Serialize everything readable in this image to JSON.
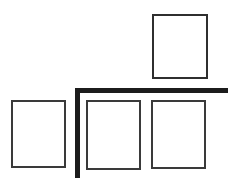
{
  "diagram": {
    "canvas": {
      "width": 236,
      "height": 188,
      "background_color": "#ffffff"
    },
    "stroke_color": "#2b2b2b",
    "bar_color": "#1c1c1c",
    "fill_color": "#ffffff",
    "shapes": [
      {
        "name": "rectangle-top",
        "label": "",
        "x": 152,
        "y": 14,
        "width": 56,
        "height": 65,
        "border_width": 2,
        "border_color": "#2f2f2f",
        "fill": "#ffffff"
      },
      {
        "name": "rectangle-bottom-left",
        "label": "",
        "x": 11,
        "y": 100,
        "width": 55,
        "height": 68,
        "border_width": 2,
        "border_color": "#3a3a3a",
        "fill": "#ffffff"
      },
      {
        "name": "rectangle-bottom-middle",
        "label": "",
        "x": 86,
        "y": 100,
        "width": 55,
        "height": 70,
        "border_width": 2,
        "border_color": "#3a3a3a",
        "fill": "#ffffff"
      },
      {
        "name": "rectangle-bottom-right",
        "label": "",
        "x": 151,
        "y": 100,
        "width": 55,
        "height": 69,
        "border_width": 2,
        "border_color": "#3a3a3a",
        "fill": "#ffffff"
      }
    ],
    "bars": [
      {
        "name": "horizontal-bar",
        "label": "",
        "x": 75,
        "y": 88,
        "width": 153,
        "height": 5,
        "color": "#1c1c1c"
      },
      {
        "name": "vertical-bar",
        "label": "",
        "x": 75,
        "y": 88,
        "width": 5,
        "height": 90,
        "color": "#1c1c1c"
      }
    ]
  }
}
